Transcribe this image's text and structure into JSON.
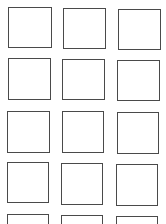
{
  "grid": {
    "columns": 3,
    "rows_visible": 5,
    "border_color": "#4a4a4a",
    "background": "#ffffff",
    "boxes": [
      {
        "row": 0,
        "col": 0,
        "x": 8,
        "y": 7,
        "w": 44,
        "h": 41
      },
      {
        "row": 0,
        "col": 1,
        "x": 63,
        "y": 8,
        "w": 43,
        "h": 41
      },
      {
        "row": 0,
        "col": 2,
        "x": 118,
        "y": 9,
        "w": 43,
        "h": 41
      },
      {
        "row": 1,
        "col": 0,
        "x": 8,
        "y": 58,
        "w": 43,
        "h": 42
      },
      {
        "row": 1,
        "col": 1,
        "x": 62,
        "y": 59,
        "w": 43,
        "h": 41
      },
      {
        "row": 1,
        "col": 2,
        "x": 117,
        "y": 60,
        "w": 43,
        "h": 41
      },
      {
        "row": 2,
        "col": 0,
        "x": 7,
        "y": 111,
        "w": 43,
        "h": 42
      },
      {
        "row": 2,
        "col": 1,
        "x": 62,
        "y": 111,
        "w": 42,
        "h": 42
      },
      {
        "row": 2,
        "col": 2,
        "x": 117,
        "y": 112,
        "w": 42,
        "h": 42
      },
      {
        "row": 3,
        "col": 0,
        "x": 7,
        "y": 162,
        "w": 42,
        "h": 41
      },
      {
        "row": 3,
        "col": 1,
        "x": 61,
        "y": 163,
        "w": 42,
        "h": 42
      },
      {
        "row": 3,
        "col": 2,
        "x": 116,
        "y": 164,
        "w": 42,
        "h": 42
      },
      {
        "row": 4,
        "col": 0,
        "x": 7,
        "y": 214,
        "w": 42,
        "h": 41
      },
      {
        "row": 4,
        "col": 1,
        "x": 61,
        "y": 215,
        "w": 42,
        "h": 41
      },
      {
        "row": 4,
        "col": 2,
        "x": 116,
        "y": 216,
        "w": 42,
        "h": 41
      }
    ]
  }
}
